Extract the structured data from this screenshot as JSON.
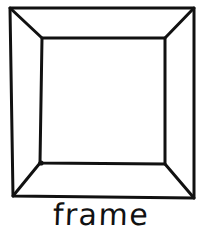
{
  "image": {
    "kind": "line-drawing",
    "subject": "picture frame in perspective",
    "width": 202,
    "height": 234,
    "background_color": "#ffffff",
    "ink_color": "#111111",
    "stroke_width": 3
  },
  "caption": {
    "label": "frame"
  },
  "drawing": {
    "outer_rectangle": {
      "name": "outer-frame-edge",
      "points": "10,8 194,8 194,198 13,196"
    },
    "inner_rectangle": {
      "name": "inner-frame-opening",
      "points": "42,38 165,38 165,164 40,163"
    },
    "diagonals": [
      {
        "name": "corner-diagonal-top-left",
        "x1": 10,
        "y1": 8,
        "x2": 42,
        "y2": 38
      },
      {
        "name": "corner-diagonal-top-right",
        "x1": 194,
        "y1": 8,
        "x2": 165,
        "y2": 38
      },
      {
        "name": "corner-diagonal-bottom-right",
        "x1": 194,
        "y1": 198,
        "x2": 165,
        "y2": 164
      },
      {
        "name": "corner-diagonal-bottom-left",
        "x1": 13,
        "y1": 196,
        "x2": 40,
        "y2": 163
      }
    ],
    "accent_nub": {
      "name": "ink-blot-bottom-left-inner-corner",
      "cx": 41,
      "cy": 163,
      "r": 2.6
    }
  }
}
